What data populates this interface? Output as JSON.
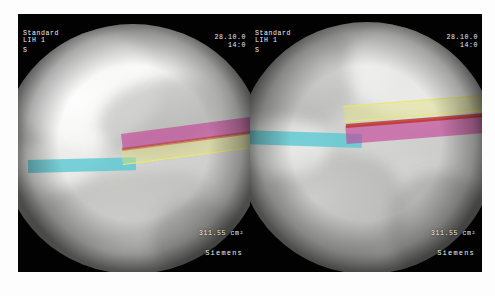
{
  "viewer": {
    "name": "fluoroscopy-dual-view",
    "modality": "Siemens C-arm fluoroscopy",
    "panel_count": 2
  },
  "panels": [
    {
      "id": "left",
      "view_label": "lateral-view",
      "osd": {
        "protocol": "Standard",
        "sub_line": "LIH 1",
        "extra_line": "S",
        "date": "28.10.0",
        "time": "14:0",
        "dose_area_product": "311.55 cm²",
        "vendor": "Siemens"
      },
      "overlays": [
        {
          "name": "cannula-cyan",
          "color": "#56c8d2",
          "role": "access cannula"
        },
        {
          "name": "implant-magenta",
          "color": "#c53f98",
          "role": "implant body"
        },
        {
          "name": "guide-yellow",
          "color": "#e9e96a",
          "role": "guide / trajectory"
        },
        {
          "name": "marker-red",
          "color": "#be3028",
          "role": "centerline marker"
        }
      ]
    },
    {
      "id": "right",
      "view_label": "ap-view",
      "osd": {
        "protocol": "Standard",
        "sub_line": "LIH 1",
        "extra_line": "S",
        "date": "28.10.0",
        "time": "14:0",
        "dose_area_product": "311.55 cm²",
        "vendor": "Siemens"
      },
      "overlays": [
        {
          "name": "cannula-cyan",
          "color": "#56c8d2",
          "role": "access cannula"
        },
        {
          "name": "guide-yellow",
          "color": "#e9e96a",
          "role": "guide / trajectory"
        },
        {
          "name": "implant-magenta",
          "color": "#c53f98",
          "role": "implant body"
        },
        {
          "name": "marker-red",
          "color": "#be3028",
          "role": "centerline marker"
        }
      ]
    }
  ]
}
